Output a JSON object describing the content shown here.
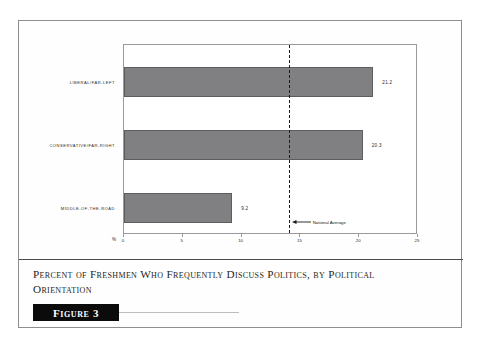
{
  "figure": {
    "caption": "Percent of Freshmen Who Frequently Discuss Politics, by Political Orientation",
    "banner_label": "Figure 3"
  },
  "chart_data": {
    "type": "bar",
    "orientation": "horizontal",
    "title": "",
    "xlabel": "%",
    "ylabel": "",
    "xlim": [
      0,
      25
    ],
    "xticks": [
      0,
      5,
      10,
      15,
      20,
      25
    ],
    "xtick_labels": [
      "0",
      "5",
      "10",
      "15",
      "20",
      "25"
    ],
    "grid": false,
    "legend": false,
    "categories": [
      "LIBERAL/FAR-LEFT",
      "CONSERVATIVE/FAR-RIGHT",
      "MIDDLE-OF-THE-ROAD"
    ],
    "values": [
      21.2,
      20.3,
      9.2
    ],
    "value_labels": [
      "21.2",
      "20.3",
      "9.2"
    ],
    "bar_color": "#808083",
    "bar_edge_color": "#5d5d60",
    "annotations": [
      {
        "label": "National Average",
        "value": 14.0,
        "style": "dashed-vertical-line",
        "color": "#1a1a1a"
      }
    ]
  }
}
